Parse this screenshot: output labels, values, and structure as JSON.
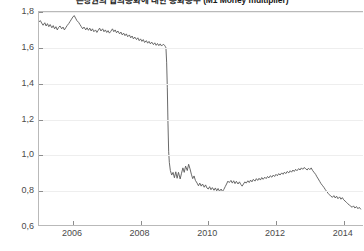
{
  "chart_data": {
    "type": "line",
    "title": "은행권의 협의통화에 대한 통화승수 (M1 Money multiplier)",
    "subtitle": "",
    "xlabel": "",
    "ylabel": "",
    "xlim": [
      2005.0,
      2014.6
    ],
    "ylim": [
      0.6,
      1.8
    ],
    "ytick_labels": [
      "1,8",
      "1,6",
      "1,4",
      "1,2",
      "1,0",
      "0,8",
      "0,6"
    ],
    "ytick_values": [
      1.8,
      1.6,
      1.4,
      1.2,
      1.0,
      0.8,
      0.6
    ],
    "xtick_labels": [
      "2006",
      "2008",
      "2010",
      "2012",
      "2014"
    ],
    "xtick_values": [
      2006,
      2008,
      2010,
      2012,
      2014
    ],
    "grid": true,
    "legend": false,
    "legend_position": "none",
    "line_color": "#595959",
    "line_width": 0.9,
    "series": [
      {
        "name": "M1 Money multiplier",
        "x": [
          2005.0,
          2005.04,
          2005.08,
          2005.12,
          2005.17,
          2005.21,
          2005.25,
          2005.29,
          2005.33,
          2005.38,
          2005.42,
          2005.46,
          2005.5,
          2005.54,
          2005.58,
          2005.62,
          2005.67,
          2005.71,
          2005.75,
          2005.79,
          2005.83,
          2005.88,
          2005.92,
          2005.96,
          2006.0,
          2006.04,
          2006.08,
          2006.12,
          2006.17,
          2006.21,
          2006.25,
          2006.29,
          2006.33,
          2006.38,
          2006.42,
          2006.46,
          2006.5,
          2006.54,
          2006.58,
          2006.62,
          2006.67,
          2006.71,
          2006.75,
          2006.79,
          2006.83,
          2006.88,
          2006.92,
          2006.96,
          2007.0,
          2007.04,
          2007.08,
          2007.12,
          2007.17,
          2007.21,
          2007.25,
          2007.29,
          2007.33,
          2007.38,
          2007.42,
          2007.46,
          2007.5,
          2007.54,
          2007.58,
          2007.62,
          2007.67,
          2007.71,
          2007.75,
          2007.79,
          2007.83,
          2007.88,
          2007.92,
          2007.96,
          2008.0,
          2008.04,
          2008.08,
          2008.12,
          2008.17,
          2008.21,
          2008.25,
          2008.29,
          2008.33,
          2008.38,
          2008.42,
          2008.46,
          2008.5,
          2008.54,
          2008.58,
          2008.62,
          2008.67,
          2008.71,
          2008.73,
          2008.75,
          2008.77,
          2008.79,
          2008.81,
          2008.83,
          2008.85,
          2008.88,
          2008.92,
          2008.96,
          2009.0,
          2009.04,
          2009.08,
          2009.12,
          2009.17,
          2009.21,
          2009.25,
          2009.29,
          2009.33,
          2009.38,
          2009.42,
          2009.46,
          2009.5,
          2009.54,
          2009.58,
          2009.62,
          2009.67,
          2009.71,
          2009.75,
          2009.79,
          2009.83,
          2009.88,
          2009.92,
          2009.96,
          2010.0,
          2010.04,
          2010.08,
          2010.12,
          2010.17,
          2010.21,
          2010.25,
          2010.29,
          2010.33,
          2010.38,
          2010.42,
          2010.46,
          2010.5,
          2010.54,
          2010.58,
          2010.62,
          2010.67,
          2010.71,
          2010.75,
          2010.79,
          2010.83,
          2010.88,
          2010.92,
          2010.96,
          2011.0,
          2011.04,
          2011.08,
          2011.12,
          2011.17,
          2011.21,
          2011.25,
          2011.29,
          2011.33,
          2011.38,
          2011.42,
          2011.46,
          2011.5,
          2011.54,
          2011.58,
          2011.62,
          2011.67,
          2011.71,
          2011.75,
          2011.79,
          2011.83,
          2011.88,
          2011.92,
          2011.96,
          2012.0,
          2012.04,
          2012.08,
          2012.12,
          2012.17,
          2012.21,
          2012.25,
          2012.29,
          2012.33,
          2012.38,
          2012.42,
          2012.46,
          2012.5,
          2012.54,
          2012.58,
          2012.62,
          2012.67,
          2012.71,
          2012.75,
          2012.79,
          2012.83,
          2012.88,
          2012.92,
          2012.96,
          2013.0,
          2013.04,
          2013.08,
          2013.12,
          2013.17,
          2013.21,
          2013.25,
          2013.29,
          2013.33,
          2013.38,
          2013.42,
          2013.46,
          2013.5,
          2013.54,
          2013.58,
          2013.62,
          2013.67,
          2013.71,
          2013.75,
          2013.79,
          2013.83,
          2013.88,
          2013.92,
          2013.96,
          2014.0,
          2014.04,
          2014.08,
          2014.12,
          2014.17,
          2014.21,
          2014.25,
          2014.29,
          2014.33,
          2014.38,
          2014.42,
          2014.46,
          2014.5
        ],
        "y": [
          1.745,
          1.752,
          1.738,
          1.726,
          1.74,
          1.722,
          1.735,
          1.718,
          1.73,
          1.712,
          1.724,
          1.706,
          1.718,
          1.7,
          1.714,
          1.722,
          1.706,
          1.716,
          1.7,
          1.712,
          1.724,
          1.736,
          1.748,
          1.76,
          1.772,
          1.78,
          1.766,
          1.752,
          1.742,
          1.73,
          1.718,
          1.706,
          1.716,
          1.7,
          1.712,
          1.698,
          1.71,
          1.694,
          1.706,
          1.69,
          1.7,
          1.686,
          1.698,
          1.71,
          1.694,
          1.706,
          1.69,
          1.7,
          1.686,
          1.696,
          1.682,
          1.692,
          1.706,
          1.69,
          1.7,
          1.684,
          1.694,
          1.678,
          1.688,
          1.672,
          1.682,
          1.668,
          1.678,
          1.662,
          1.672,
          1.656,
          1.666,
          1.65,
          1.66,
          1.646,
          1.656,
          1.64,
          1.65,
          1.636,
          1.646,
          1.63,
          1.64,
          1.626,
          1.636,
          1.622,
          1.632,
          1.618,
          1.628,
          1.614,
          1.624,
          1.612,
          1.622,
          1.61,
          1.62,
          1.614,
          1.608,
          1.6,
          1.52,
          1.38,
          1.18,
          1.02,
          0.96,
          0.915,
          0.89,
          0.905,
          0.875,
          0.908,
          0.872,
          0.905,
          0.868,
          0.9,
          0.93,
          0.905,
          0.94,
          0.915,
          0.95,
          0.925,
          0.895,
          0.87,
          0.885,
          0.86,
          0.845,
          0.83,
          0.845,
          0.828,
          0.84,
          0.822,
          0.835,
          0.818,
          0.812,
          0.825,
          0.808,
          0.82,
          0.805,
          0.818,
          0.802,
          0.815,
          0.8,
          0.812,
          0.798,
          0.81,
          0.825,
          0.84,
          0.856,
          0.848,
          0.86,
          0.845,
          0.858,
          0.842,
          0.855,
          0.84,
          0.852,
          0.838,
          0.828,
          0.84,
          0.852,
          0.845,
          0.858,
          0.848,
          0.862,
          0.852,
          0.866,
          0.856,
          0.87,
          0.86,
          0.872,
          0.862,
          0.876,
          0.866,
          0.878,
          0.87,
          0.882,
          0.874,
          0.886,
          0.878,
          0.89,
          0.882,
          0.894,
          0.886,
          0.898,
          0.89,
          0.902,
          0.894,
          0.906,
          0.898,
          0.91,
          0.902,
          0.914,
          0.906,
          0.918,
          0.91,
          0.922,
          0.914,
          0.926,
          0.918,
          0.93,
          0.922,
          0.932,
          0.925,
          0.918,
          0.928,
          0.92,
          0.93,
          0.916,
          0.906,
          0.894,
          0.88,
          0.868,
          0.855,
          0.842,
          0.83,
          0.82,
          0.808,
          0.798,
          0.788,
          0.78,
          0.772,
          0.766,
          0.775,
          0.762,
          0.772,
          0.758,
          0.768,
          0.755,
          0.764,
          0.752,
          0.745,
          0.738,
          0.73,
          0.722,
          0.716,
          0.71,
          0.718,
          0.706,
          0.714,
          0.702,
          0.71,
          0.7
        ]
      }
    ]
  }
}
